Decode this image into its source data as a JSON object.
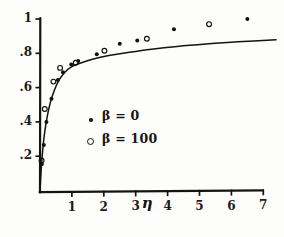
{
  "figure": {
    "background_color": "#fdfdfc",
    "ink_color": "#111111"
  },
  "axes": {
    "x": {
      "label": "η",
      "label_position_value": 3.35,
      "ticks": [
        "1",
        "2",
        "3",
        "4",
        "5",
        "6",
        "7"
      ],
      "tick_values": [
        1,
        2,
        3,
        4,
        5,
        6,
        7
      ],
      "range": [
        0,
        7.6
      ]
    },
    "y": {
      "label": "",
      "ticks": [
        "1",
        ".8",
        ".6",
        ".4",
        ".2"
      ],
      "tick_values": [
        1,
        0.8,
        0.6,
        0.4,
        0.2
      ],
      "range": [
        0,
        1.06
      ]
    }
  },
  "legend": {
    "entries": [
      {
        "marker": "filled-circle",
        "label": "β = 0"
      },
      {
        "marker": "open-circle",
        "label": "β = 100"
      }
    ],
    "position_value": {
      "x": 2.6,
      "y": 0.44
    }
  },
  "chart_data": {
    "type": "scatter",
    "title": "",
    "xlabel": "η",
    "ylabel": "",
    "xlim": [
      0,
      7.6
    ],
    "ylim": [
      0,
      1.06
    ],
    "grid": false,
    "legend_position": "center-right",
    "series": [
      {
        "name": "β = 0",
        "marker": "filled-circle",
        "color": "#111111",
        "points": [
          {
            "x": 0.06,
            "y": 0.155
          },
          {
            "x": 0.12,
            "y": 0.265
          },
          {
            "x": 0.2,
            "y": 0.4
          },
          {
            "x": 0.36,
            "y": 0.535
          },
          {
            "x": 0.56,
            "y": 0.645
          },
          {
            "x": 0.72,
            "y": 0.69
          },
          {
            "x": 0.98,
            "y": 0.735
          },
          {
            "x": 1.2,
            "y": 0.755
          },
          {
            "x": 1.78,
            "y": 0.795
          },
          {
            "x": 2.5,
            "y": 0.855
          },
          {
            "x": 3.05,
            "y": 0.875
          },
          {
            "x": 4.2,
            "y": 0.94
          },
          {
            "x": 6.5,
            "y": 1.0
          }
        ]
      },
      {
        "name": "β = 100",
        "marker": "open-circle",
        "color": "#111111",
        "points": [
          {
            "x": 0.05,
            "y": 0.175
          },
          {
            "x": 0.15,
            "y": 0.475
          },
          {
            "x": 0.42,
            "y": 0.635
          },
          {
            "x": 0.63,
            "y": 0.715
          },
          {
            "x": 1.12,
            "y": 0.745
          },
          {
            "x": 2.02,
            "y": 0.815
          },
          {
            "x": 3.35,
            "y": 0.885
          },
          {
            "x": 5.3,
            "y": 0.97
          }
        ]
      }
    ],
    "curve": {
      "name": "theory-curve",
      "color": "#111111",
      "points": [
        {
          "x": 0.0,
          "y": 0.0
        },
        {
          "x": 0.04,
          "y": 0.13
        },
        {
          "x": 0.08,
          "y": 0.225
        },
        {
          "x": 0.14,
          "y": 0.33
        },
        {
          "x": 0.22,
          "y": 0.425
        },
        {
          "x": 0.32,
          "y": 0.51
        },
        {
          "x": 0.45,
          "y": 0.585
        },
        {
          "x": 0.6,
          "y": 0.645
        },
        {
          "x": 0.78,
          "y": 0.69
        },
        {
          "x": 1.0,
          "y": 0.722
        },
        {
          "x": 1.3,
          "y": 0.745
        },
        {
          "x": 1.7,
          "y": 0.768
        },
        {
          "x": 2.2,
          "y": 0.788
        },
        {
          "x": 2.8,
          "y": 0.806
        },
        {
          "x": 3.5,
          "y": 0.824
        },
        {
          "x": 4.3,
          "y": 0.84
        },
        {
          "x": 5.2,
          "y": 0.854
        },
        {
          "x": 6.2,
          "y": 0.867
        },
        {
          "x": 7.4,
          "y": 0.879
        }
      ]
    }
  }
}
